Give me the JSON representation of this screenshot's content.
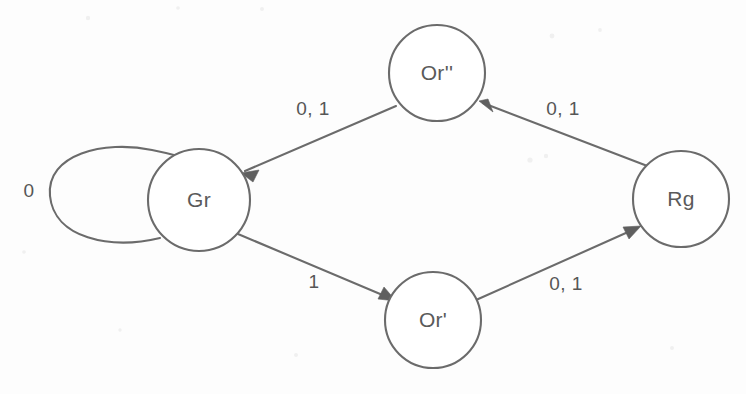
{
  "diagram": {
    "type": "finite-state-machine",
    "background_color": "#fdfdfd",
    "stroke_color": "#6b6b6b",
    "text_color": "#565656",
    "nodes": [
      {
        "id": "Gr",
        "label": "Gr",
        "cx": 199,
        "cy": 200,
        "r": 51
      },
      {
        "id": "Or2",
        "label": "Or''",
        "cx": 437,
        "cy": 73,
        "r": 48
      },
      {
        "id": "Or1",
        "label": "Or'",
        "cx": 433,
        "cy": 320,
        "r": 48
      },
      {
        "id": "Rg",
        "label": "Rg",
        "cx": 681,
        "cy": 199,
        "r": 48
      }
    ],
    "edges": [
      {
        "id": "gr-self",
        "from": "Gr",
        "to": "Gr",
        "label": "0",
        "label_x": 29,
        "label_y": 192
      },
      {
        "id": "gr-or1",
        "from": "Gr",
        "to": "Or1",
        "label": "1",
        "label_x": 314,
        "label_y": 283
      },
      {
        "id": "or1-rg",
        "from": "Or1",
        "to": "Rg",
        "label": "0, 1",
        "label_x": 566,
        "label_y": 285
      },
      {
        "id": "rg-or2",
        "from": "Rg",
        "to": "Or2",
        "label": "0, 1",
        "label_x": 563,
        "label_y": 110
      },
      {
        "id": "or2-gr",
        "from": "Or2",
        "to": "Gr",
        "label": "0, 1",
        "label_x": 313,
        "label_y": 110
      }
    ]
  }
}
